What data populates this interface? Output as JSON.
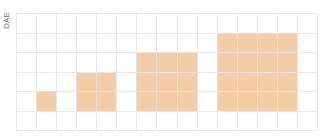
{
  "chart_data": {
    "type": "heatmap",
    "title": "",
    "xlabel": "",
    "ylabel": "DAE",
    "grid": true,
    "grid_columns": 15,
    "grid_rows": 6,
    "fill_color": "#f4cda6",
    "grid_color": "#e4e4e4",
    "series": [
      {
        "name": "square-1",
        "size": 1,
        "col_start": 1,
        "row_bottom": 5,
        "values": [
          1
        ]
      },
      {
        "name": "square-2",
        "size": 2,
        "col_start": 3,
        "row_bottom": 5,
        "values": [
          4
        ]
      },
      {
        "name": "square-3",
        "size": 3,
        "col_start": 6,
        "row_bottom": 5,
        "values": [
          9
        ]
      },
      {
        "name": "square-4",
        "size": 4,
        "col_start": 10,
        "row_bottom": 5,
        "values": [
          16
        ]
      }
    ]
  },
  "axis": {
    "ylabel": "DAE"
  }
}
